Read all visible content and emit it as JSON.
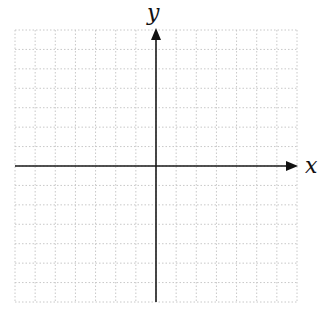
{
  "diagram": {
    "type": "coordinate-plane",
    "x_axis_label": "x",
    "y_axis_label": "y",
    "grid": {
      "columns": 14,
      "rows": 14,
      "left": 15,
      "top": 30,
      "right": 297,
      "bottom": 302,
      "style": "dotted",
      "color": "#c8c8c8"
    },
    "axes": {
      "origin_x": 156,
      "origin_y": 166,
      "color": "#1a1a1a"
    }
  }
}
